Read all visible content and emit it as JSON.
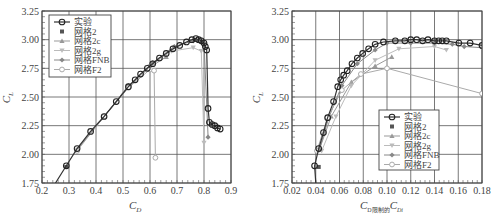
{
  "figure": {
    "panels": 2
  },
  "chart_data": [
    {
      "type": "line",
      "panel": "left",
      "title": "",
      "xlabel": "C_D",
      "ylabel": "C_L",
      "xlim": [
        0.2,
        0.9
      ],
      "ylim": [
        1.75,
        3.25
      ],
      "xticks": [
        "0.2",
        "0.3",
        "0.4",
        "0.5",
        "0.6",
        "0.7",
        "0.8",
        "0.9"
      ],
      "yticks": [
        "1.75",
        "2.00",
        "2.25",
        "2.50",
        "2.75",
        "3.00",
        "3.25"
      ],
      "grid": true,
      "legend_position": "upper-left",
      "legend": [
        "实验",
        "网格2",
        "网格2c",
        "网格2g",
        "网格FNB",
        "网格F2"
      ],
      "series": [
        {
          "name": "实验",
          "marker": "circle-open",
          "color": "#333333",
          "x": [
            0.25,
            0.29,
            0.33,
            0.38,
            0.43,
            0.475,
            0.52,
            0.545,
            0.565,
            0.59,
            0.61,
            0.635,
            0.66,
            0.685,
            0.71,
            0.735,
            0.755,
            0.77,
            0.78,
            0.79,
            0.8,
            0.805,
            0.81,
            0.815,
            0.82,
            0.83,
            0.84,
            0.85,
            0.86
          ],
          "y": [
            1.75,
            1.9,
            2.05,
            2.2,
            2.33,
            2.46,
            2.59,
            2.65,
            2.7,
            2.75,
            2.79,
            2.84,
            2.88,
            2.92,
            2.95,
            2.98,
            3.0,
            3.01,
            3.0,
            2.99,
            2.97,
            2.94,
            2.91,
            2.4,
            2.28,
            2.26,
            2.25,
            2.23,
            2.22
          ]
        },
        {
          "name": "网格2",
          "marker": "square-filled",
          "color": "#555555",
          "x": [
            0.29
          ],
          "y": [
            1.89
          ]
        },
        {
          "name": "网格2c",
          "marker": "triangle",
          "color": "#999999",
          "x": [
            0.33,
            0.43,
            0.52,
            0.6,
            0.66
          ],
          "y": [
            2.04,
            2.33,
            2.59,
            2.76,
            2.85
          ]
        },
        {
          "name": "网格2g",
          "marker": "triangle-down",
          "color": "#bbbbbb",
          "x": [
            0.43,
            0.52,
            0.6,
            0.68,
            0.76,
            0.79,
            0.8
          ],
          "y": [
            2.33,
            2.59,
            2.77,
            2.9,
            2.93,
            2.9,
            2.1
          ]
        },
        {
          "name": "网格FNB",
          "marker": "diamond-filled",
          "color": "#888888",
          "x": [
            0.33,
            0.43,
            0.52,
            0.61,
            0.69,
            0.76,
            0.8,
            0.815
          ],
          "y": [
            2.04,
            2.33,
            2.6,
            2.8,
            2.94,
            2.99,
            2.97,
            2.15
          ]
        },
        {
          "name": "网格F2",
          "marker": "circle-open-light",
          "color": "#aaaaaa",
          "x": [
            0.33,
            0.43,
            0.52,
            0.6,
            0.615,
            0.62
          ],
          "y": [
            2.03,
            2.33,
            2.58,
            2.74,
            2.73,
            1.97
          ]
        }
      ]
    },
    {
      "type": "line",
      "panel": "right",
      "title": "",
      "xlabel": "C_D限制的C_Di",
      "ylabel": "C_L",
      "xlim": [
        0.02,
        0.18
      ],
      "ylim": [
        1.75,
        3.25
      ],
      "xticks": [
        "0.02",
        "0.04",
        "0.06",
        "0.08",
        "0.10",
        "0.12",
        "0.14",
        "0.16",
        "0.18"
      ],
      "yticks": [
        "1.75",
        "2.00",
        "2.25",
        "2.50",
        "2.75",
        "3.00",
        "3.25"
      ],
      "grid": true,
      "legend_position": "lower-center-right",
      "legend": [
        "实验",
        "网格2",
        "网格2c",
        "网格2g",
        "网格FNB",
        "网格F2"
      ],
      "series": [
        {
          "name": "实验",
          "marker": "circle-open",
          "color": "#333333",
          "x": [
            0.04,
            0.039,
            0.0425,
            0.0465,
            0.05,
            0.055,
            0.0585,
            0.061,
            0.0635,
            0.0665,
            0.0705,
            0.075,
            0.0795,
            0.0845,
            0.09,
            0.097,
            0.107,
            0.115,
            0.12,
            0.125,
            0.13,
            0.1345,
            0.14,
            0.1435,
            0.1465,
            0.15,
            0.1605,
            0.17,
            0.18
          ],
          "y": [
            1.75,
            1.9,
            2.05,
            2.19,
            2.32,
            2.46,
            2.59,
            2.65,
            2.69,
            2.73,
            2.79,
            2.84,
            2.88,
            2.92,
            2.96,
            2.98,
            2.99,
            2.99,
            3.0,
            3.0,
            2.99,
            3.0,
            2.99,
            2.99,
            2.99,
            2.99,
            2.97,
            2.97,
            2.95
          ]
        },
        {
          "name": "网格2",
          "marker": "square-filled",
          "color": "#555555",
          "x": [
            0.0425
          ],
          "y": [
            1.89
          ]
        },
        {
          "name": "网格2c",
          "marker": "triangle",
          "color": "#999999",
          "x": [
            0.043,
            0.053,
            0.07,
            0.09,
            0.104
          ],
          "y": [
            2.04,
            2.33,
            2.63,
            2.77,
            2.85
          ]
        },
        {
          "name": "网格2g",
          "marker": "triangle-down",
          "color": "#bbbbbb",
          "x": [
            0.045,
            0.057,
            0.07,
            0.09,
            0.11,
            0.14,
            0.15
          ],
          "y": [
            2.03,
            2.33,
            2.6,
            2.82,
            2.92,
            2.94,
            2.91
          ]
        },
        {
          "name": "网格FNB",
          "marker": "diamond-filled",
          "color": "#888888",
          "x": [
            0.043,
            0.051,
            0.062,
            0.075,
            0.09,
            0.1,
            0.12,
            0.14,
            0.155,
            0.165,
            0.18
          ],
          "y": [
            2.04,
            2.32,
            2.6,
            2.79,
            2.91,
            2.97,
            2.97,
            2.97,
            2.96,
            2.94,
            2.93
          ]
        },
        {
          "name": "网格F2",
          "marker": "circle-open-light",
          "color": "#aaaaaa",
          "x": [
            0.041,
            0.05,
            0.062,
            0.078,
            0.1,
            0.18
          ],
          "y": [
            2.03,
            2.32,
            2.56,
            2.7,
            2.75,
            2.53
          ]
        }
      ]
    }
  ],
  "panels": {
    "left": {
      "xlabel_main": "C",
      "xlabel_sub": "D",
      "ylabel_main": "C",
      "ylabel_sub": "L"
    },
    "right": {
      "xlabel_main": "C",
      "xlabel_sub": "D限制的",
      "xlabel_main2": "C",
      "xlabel_sub2": "Di",
      "ylabel_main": "C",
      "ylabel_sub": "L"
    }
  }
}
